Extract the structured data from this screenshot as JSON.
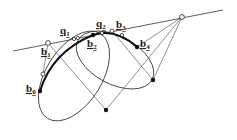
{
  "diagram": {
    "labels": {
      "b0": {
        "main": "b",
        "sub": "0"
      },
      "b1": {
        "main": "b",
        "sub": "1"
      },
      "b2": {
        "main": "b",
        "sub": "2"
      },
      "b3": {
        "main": "b",
        "sub": "3"
      },
      "b4": {
        "main": "b",
        "sub": "4"
      },
      "q1": {
        "main": "q",
        "sub": "1"
      },
      "q2": {
        "main": "q",
        "sub": "2"
      }
    },
    "colors": {
      "stroke": "#333333",
      "curve": "#111111",
      "background": "#ffffff"
    }
  }
}
